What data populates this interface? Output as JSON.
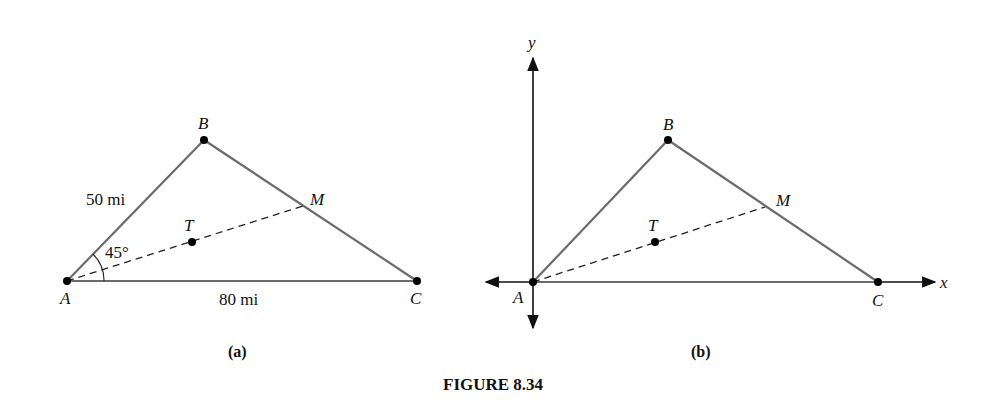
{
  "figure_title": "FIGURE 8.34",
  "panel_a": {
    "caption": "(a)",
    "points": {
      "A": "A",
      "B": "B",
      "C": "C",
      "M": "M",
      "T": "T"
    },
    "side_AB_label": "50 mi",
    "side_AC_label": "80 mi",
    "angle_A_label": "45°"
  },
  "panel_b": {
    "caption": "(b)",
    "points": {
      "A": "A",
      "B": "B",
      "C": "C",
      "M": "M",
      "T": "T"
    },
    "x_axis_label": "x",
    "y_axis_label": "y"
  },
  "colors": {
    "triangle_sides": "#6b6b6b",
    "median": "#222222",
    "axes": "#111111",
    "points": "#000000"
  }
}
